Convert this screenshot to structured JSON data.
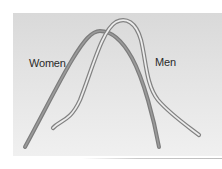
{
  "diagram": {
    "type": "overlapping-distribution-curves",
    "labels": {
      "women": "Women",
      "men": "Men"
    },
    "curves": [
      {
        "name": "Women",
        "style": "solid gray tube",
        "color": "#8a8a8a",
        "position": "left"
      },
      {
        "name": "Men",
        "style": "hollow outlined tube",
        "color": "#8a8a8a",
        "fill": "#e8e8e8",
        "position": "right"
      }
    ],
    "colors": {
      "background": "#ffffff",
      "panel": "#e0e0e0",
      "curve_stroke": "#8a8a8a",
      "label_text": "#2a2a2a"
    }
  }
}
